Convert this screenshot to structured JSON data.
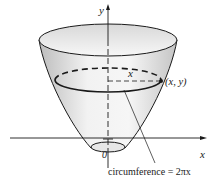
{
  "figure": {
    "type": "paraboloid-surface-of-revolution",
    "labels": {
      "y_axis": "y",
      "x_axis": "x",
      "origin": "0",
      "radius": "x",
      "point": "(x, y)",
      "annotation": "circumference = 2πx"
    },
    "colors": {
      "stroke": "#1a1a1a",
      "surface_light": "#f4f4f4",
      "surface_dark": "#c9c9c9"
    }
  }
}
